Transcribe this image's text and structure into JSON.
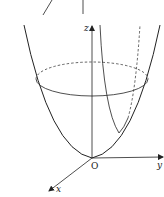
{
  "figure": {
    "axes": {
      "x_label": "x",
      "y_label": "y",
      "z_label": "z",
      "origin_label": "O"
    },
    "colors": {
      "stroke": "#222222",
      "background": "#ffffff"
    }
  }
}
